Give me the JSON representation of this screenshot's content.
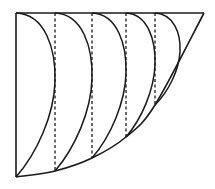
{
  "diagram": {
    "stroke_color": "#1a1a1a",
    "background": "#ffffff",
    "top_line": {
      "x1": 16,
      "y1": 13,
      "x2": 204,
      "y2": 13
    },
    "left_line": {
      "x1": 16,
      "y1": 13,
      "x2": 16,
      "y2": 177
    },
    "outer_curve_points": [
      [
        16,
        177
      ],
      [
        55,
        171
      ],
      [
        92,
        158
      ],
      [
        126,
        137
      ],
      [
        155,
        105
      ],
      [
        204,
        13
      ]
    ],
    "dashed_lines": [
      {
        "x": 55,
        "y_top": 13,
        "y_bottom": 171
      },
      {
        "x": 92,
        "y_top": 13,
        "y_bottom": 158
      },
      {
        "x": 126,
        "y_top": 13,
        "y_bottom": 137
      },
      {
        "x": 155,
        "y_top": 13,
        "y_bottom": 105
      }
    ],
    "arcs": [
      {
        "start": [
          16,
          13
        ],
        "bulge_x": 55,
        "end": [
          16,
          177
        ]
      },
      {
        "start": [
          55,
          13
        ],
        "bulge_x": 92,
        "end": [
          55,
          171
        ]
      },
      {
        "start": [
          92,
          13
        ],
        "bulge_x": 126,
        "end": [
          92,
          158
        ]
      },
      {
        "start": [
          126,
          13
        ],
        "bulge_x": 155,
        "end": [
          126,
          137
        ]
      },
      {
        "start": [
          155,
          13
        ],
        "bulge_x": 180,
        "end": [
          155,
          105
        ]
      }
    ]
  }
}
